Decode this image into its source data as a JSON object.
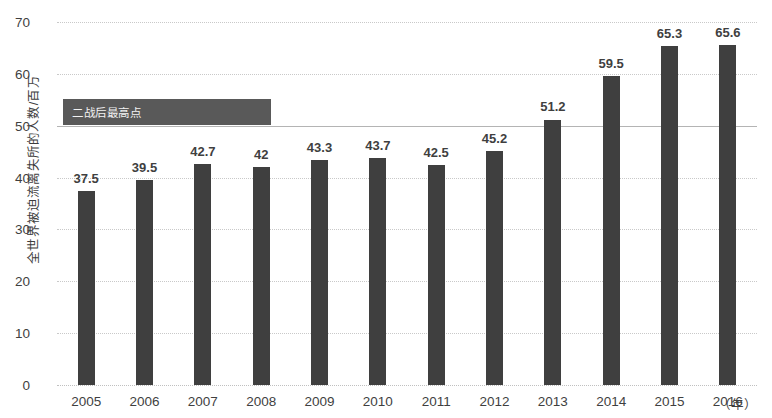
{
  "chart_data": {
    "type": "bar",
    "title": "",
    "xlabel": "（年）",
    "ylabel": "全世界被迫流离失所的人数/百万",
    "categories": [
      "2005",
      "2006",
      "2007",
      "2008",
      "2009",
      "2010",
      "2011",
      "2012",
      "2013",
      "2014",
      "2015",
      "2016"
    ],
    "values": [
      37.5,
      39.5,
      42.7,
      42,
      43.3,
      43.7,
      42.5,
      45.2,
      51.2,
      59.5,
      65.3,
      65.6
    ],
    "value_labels": [
      "37.5",
      "39.5",
      "42.7",
      "42",
      "43.3",
      "43.7",
      "42.5",
      "45.2",
      "51.2",
      "59.5",
      "65.3",
      "65.6"
    ],
    "ylim": [
      0,
      70
    ],
    "y_ticks": [
      0,
      10,
      20,
      30,
      40,
      50,
      60,
      70
    ],
    "y_tick_labels": [
      "0",
      "10",
      "20",
      "30",
      "40",
      "50",
      "60",
      "70"
    ],
    "grid": true,
    "legend": "none",
    "bar_color": "#3f3f3f",
    "gridline_color": "#c9c9c9",
    "annotations": [
      {
        "label": "二战后最高点",
        "value": 50,
        "reference_line": true,
        "box_color": "#595959",
        "text_color": "#f2f2f2"
      }
    ]
  }
}
